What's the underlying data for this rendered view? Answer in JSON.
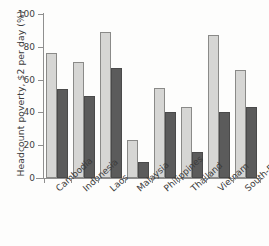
{
  "chart_data": {
    "type": "bar",
    "title": "",
    "subtitle": "",
    "xlabel": "",
    "ylabel": "Headcount poverty, $2 per day (%)",
    "ylim": [
      0,
      100
    ],
    "yticks": [
      0,
      20,
      40,
      60,
      80,
      100
    ],
    "ytick_labels": [
      "0",
      "20",
      "40",
      "60",
      "80",
      "100"
    ],
    "grid": false,
    "legend": "none",
    "categories": [
      "Cambodia",
      "Indonesia",
      "Laos",
      "Malaysia",
      "Philippines",
      "Thailand",
      "Vietnam",
      "South-East Asia"
    ],
    "series": [
      {
        "name": "earlier year",
        "color": "#d6d6d4",
        "values": [
          76,
          71,
          89,
          23,
          55,
          43,
          87,
          66
        ]
      },
      {
        "name": "later year",
        "color": "#5b5b5b",
        "values": [
          54,
          50,
          67,
          10,
          40,
          16,
          40,
          43
        ]
      }
    ]
  },
  "axis": {
    "y_title": "Headcount poverty, $2 per day (%)"
  }
}
